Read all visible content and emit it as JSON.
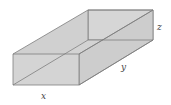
{
  "diagram": {
    "type": "open-top rectangular box",
    "labels": {
      "x": "x",
      "y": "y",
      "z": "z"
    },
    "colors": {
      "face": "#d3d3d3",
      "face_dark": "#c9c9c9",
      "edge": "#7d7d7d",
      "label": "#444444"
    }
  }
}
